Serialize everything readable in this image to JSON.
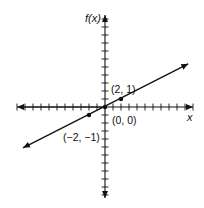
{
  "chart_data": {
    "type": "line",
    "title": "",
    "xlabel": "x",
    "ylabel": "f(x)",
    "xlim": [
      -11,
      11
    ],
    "ylim": [
      -11,
      11
    ],
    "grid": false,
    "tick_marks_every": 1,
    "tick_labels": false,
    "function": "f(x) = x/2",
    "series": [
      {
        "name": "f(x)",
        "x": [
          -10.25,
          10.4
        ],
        "y": [
          -5.1,
          5.4
        ],
        "arrows_both_ends": true
      }
    ],
    "points": [
      {
        "x": -2,
        "y": -1,
        "label": "(−2, −1)"
      },
      {
        "x": 0,
        "y": 0,
        "label": "(0, 0)"
      },
      {
        "x": 2,
        "y": 1,
        "label": "(2, 1)"
      }
    ],
    "colors": {
      "line": "#111111",
      "axis": "#111111",
      "background": "#ffffff"
    }
  },
  "labels": {
    "y_axis": "f(x)",
    "x_axis": "x",
    "point_pos": "(2, 1)",
    "point_origin": "(0, 0)",
    "point_neg": "(−2, −1)"
  }
}
